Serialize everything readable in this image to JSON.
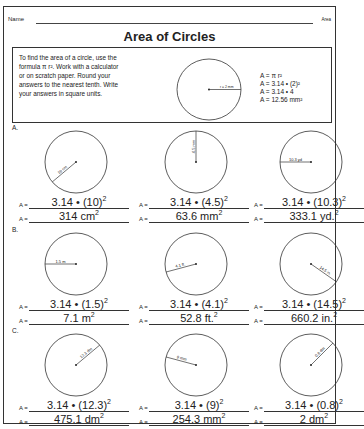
{
  "header": {
    "name_label": "Name",
    "topic": "Area",
    "title": "Area of Circles"
  },
  "intro": {
    "text": "To find the area of a circle, use the formula π r². Work with a calculator or on scratch paper. Round your answers to the nearest tenth. Write your answers in square units.",
    "example_radius_label": "r = 2 mm",
    "formula_lines": [
      "A = π r²",
      "A =  3.14 • (2)²",
      "A =  3.14 • 4",
      "A = 12.56 mm²"
    ]
  },
  "sections": [
    {
      "label": "A.",
      "problems": [
        {
          "radius_label": "10 cm",
          "substitution": "3.14 • (10)",
          "answer": "314 cm",
          "answer_sup": "2",
          "angle": 140
        },
        {
          "radius_label": "4.5 mm",
          "substitution": "3.14 • (4.5)",
          "answer": "63.6  mm",
          "answer_sup": "2",
          "angle": 270
        },
        {
          "radius_label": "10.3 yd",
          "substitution": "3.14 • (10.3)",
          "answer": "333.1 yd.",
          "answer_sup": "2",
          "angle": 180
        }
      ]
    },
    {
      "label": "B.",
      "problems": [
        {
          "radius_label": "1.5 m",
          "substitution": "3.14 •  (1.5)",
          "answer": "7.1 m",
          "answer_sup": "2",
          "angle": 180
        },
        {
          "radius_label": "4.1 ft.",
          "substitution": "3.14 • (4.1)",
          "answer": "52.8 ft.",
          "answer_sup": "2",
          "angle": 165
        },
        {
          "radius_label": "14.5 in.",
          "substitution": "3.14 • (14.5)",
          "answer": "660.2 in.",
          "answer_sup": "2",
          "angle": 35
        }
      ]
    },
    {
      "label": "C.",
      "problems": [
        {
          "radius_label": "12.3 dm",
          "substitution": "3.14 • (12.3)",
          "answer": "475.1 dm",
          "answer_sup": "2",
          "angle": -40
        },
        {
          "radius_label": "9 mm",
          "substitution": "3.14 • (9)",
          "answer": "254.3 mm",
          "answer_sup": "2",
          "angle": 195
        },
        {
          "radius_label": "0.8 dm",
          "substitution": "3.14 • (0.8)",
          "answer": "2 dm",
          "answer_sup": "2",
          "angle": -45
        }
      ]
    }
  ],
  "equation_prefix": "A =",
  "square_sup": "2"
}
